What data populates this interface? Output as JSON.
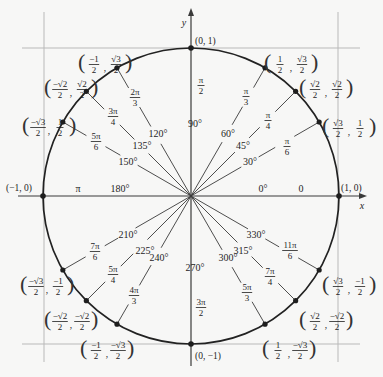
{
  "diagram": {
    "colors": {
      "background": "#f7f7f6",
      "ink": "#1e1e1e",
      "circle": "#222222",
      "radial": "#3a3a3a",
      "tangent_grid": "#b9b9b9",
      "axis": "#3a3a3a"
    },
    "geometry": {
      "cx": 191,
      "cy": 196,
      "r": 148
    },
    "axes": {
      "x_label": "x",
      "y_label": "y",
      "x_range": [
        18,
        362
      ],
      "y_range": [
        8,
        366
      ]
    },
    "tangent_lines": {
      "left_x": 44,
      "right_x": 338,
      "top_y": 48,
      "bottom_y": 344,
      "v_extent": [
        12,
        362
      ],
      "h_extent": [
        22,
        360
      ]
    },
    "axis_points": [
      {
        "deg": 0,
        "coord": "(1, 0)",
        "lx": 341,
        "ly": 191
      },
      {
        "deg": 90,
        "coord": "(0, 1)",
        "lx": 195,
        "ly": 44
      },
      {
        "deg": 180,
        "coord": "(−1, 0)",
        "lx": 6,
        "ly": 191
      },
      {
        "deg": 270,
        "coord": "(0, −1)",
        "lx": 195,
        "ly": 359
      }
    ],
    "axis_labels": [
      {
        "text": "0°",
        "x": 263,
        "y": 192,
        "cls": "deg"
      },
      {
        "text": "0",
        "x": 301,
        "y": 192,
        "cls": "deg"
      },
      {
        "text": "180°",
        "x": 120,
        "y": 192,
        "cls": "deg"
      },
      {
        "text": "π",
        "x": 78,
        "y": 192,
        "cls": "deg"
      },
      {
        "text": "90°",
        "x": 195,
        "y": 127,
        "cls": "deg"
      },
      {
        "text": "270°",
        "x": 195,
        "y": 271,
        "cls": "deg"
      }
    ],
    "axis_fracs": [
      {
        "num": "π",
        "den": "2",
        "x": 201,
        "y": 83
      },
      {
        "num": "3π",
        "den": "2",
        "x": 201,
        "y": 305
      }
    ],
    "angles": [
      {
        "deg": 30,
        "deg_label": "30°",
        "rad_num": "π",
        "rad_den": "6",
        "deg_pos": [
          250,
          162
        ],
        "rad_pos": [
          287,
          146
        ],
        "coord_x": {
          "neg": false,
          "num": "√3",
          "den": "2"
        },
        "coord_y": {
          "neg": false,
          "num": "1",
          "den": "2"
        },
        "coord_pos": [
          322,
          118
        ]
      },
      {
        "deg": 45,
        "deg_label": "45°",
        "rad_num": "π",
        "rad_den": "4",
        "deg_pos": [
          243,
          146
        ],
        "rad_pos": [
          268,
          120
        ],
        "coord_x": {
          "neg": false,
          "num": "√2",
          "den": "2"
        },
        "coord_y": {
          "neg": false,
          "num": "√2",
          "den": "2"
        },
        "coord_pos": [
          299,
          79
        ]
      },
      {
        "deg": 60,
        "deg_label": "60°",
        "rad_num": "π",
        "rad_den": "3",
        "deg_pos": [
          228,
          134
        ],
        "rad_pos": [
          246,
          96
        ],
        "coord_x": {
          "neg": false,
          "num": "1",
          "den": "2"
        },
        "coord_y": {
          "neg": false,
          "num": "√3",
          "den": "2"
        },
        "coord_pos": [
          264,
          54
        ]
      },
      {
        "deg": 120,
        "deg_label": "120°",
        "rad_num": "2π",
        "rad_den": "3",
        "deg_pos": [
          158,
          134
        ],
        "rad_pos": [
          135,
          97
        ],
        "coord_x": {
          "neg": true,
          "num": "−1",
          "den": "2"
        },
        "coord_y": {
          "neg": false,
          "num": "√3",
          "den": "2"
        },
        "coord_pos": [
          78,
          54
        ]
      },
      {
        "deg": 135,
        "deg_label": "135°",
        "rad_num": "3π",
        "rad_den": "4",
        "deg_pos": [
          142,
          146
        ],
        "rad_pos": [
          113,
          116
        ],
        "coord_x": {
          "neg": true,
          "num": "−√2",
          "den": "2"
        },
        "coord_y": {
          "neg": false,
          "num": "√2",
          "den": "2"
        },
        "coord_pos": [
          44,
          79
        ]
      },
      {
        "deg": 150,
        "deg_label": "150°",
        "rad_num": "5π",
        "rad_den": "6",
        "deg_pos": [
          128,
          162
        ],
        "rad_pos": [
          96,
          141
        ],
        "coord_x": {
          "neg": true,
          "num": "−√3",
          "den": "2"
        },
        "coord_y": {
          "neg": false,
          "num": "1",
          "den": "2"
        },
        "coord_pos": [
          22,
          117
        ]
      },
      {
        "deg": 210,
        "deg_label": "210°",
        "rad_num": "7π",
        "rad_den": "6",
        "deg_pos": [
          128,
          235
        ],
        "rad_pos": [
          95,
          251
        ],
        "coord_x": {
          "neg": true,
          "num": "−√3",
          "den": "2"
        },
        "coord_y": {
          "neg": true,
          "num": "−1",
          "den": "2"
        },
        "coord_pos": [
          20,
          276
        ]
      },
      {
        "deg": 225,
        "deg_label": "225°",
        "rad_num": "5π",
        "rad_den": "4",
        "deg_pos": [
          145,
          251
        ],
        "rad_pos": [
          113,
          274
        ],
        "coord_x": {
          "neg": true,
          "num": "−√2",
          "den": "2"
        },
        "coord_y": {
          "neg": true,
          "num": "−√2",
          "den": "2"
        },
        "coord_pos": [
          44,
          311
        ]
      },
      {
        "deg": 240,
        "deg_label": "240°",
        "rad_num": "4π",
        "rad_den": "3",
        "deg_pos": [
          159,
          258
        ],
        "rad_pos": [
          134,
          295
        ],
        "coord_x": {
          "neg": true,
          "num": "−1",
          "den": "2"
        },
        "coord_y": {
          "neg": true,
          "num": "−√3",
          "den": "2"
        },
        "coord_pos": [
          80,
          340
        ]
      },
      {
        "deg": 300,
        "deg_label": "300°",
        "rad_num": "5π",
        "rad_den": "3",
        "deg_pos": [
          228,
          258
        ],
        "rad_pos": [
          247,
          292
        ],
        "coord_x": {
          "neg": false,
          "num": "1",
          "den": "2"
        },
        "coord_y": {
          "neg": true,
          "num": "−√3",
          "den": "2"
        },
        "coord_pos": [
          262,
          340
        ]
      },
      {
        "deg": 315,
        "deg_label": "315°",
        "rad_num": "7π",
        "rad_den": "4",
        "deg_pos": [
          243,
          251
        ],
        "rad_pos": [
          270,
          276
        ],
        "coord_x": {
          "neg": false,
          "num": "√2",
          "den": "2"
        },
        "coord_y": {
          "neg": true,
          "num": "−√2",
          "den": "2"
        },
        "coord_pos": [
          299,
          311
        ]
      },
      {
        "deg": 330,
        "deg_label": "330°",
        "rad_num": "11π",
        "rad_den": "6",
        "deg_pos": [
          256,
          235
        ],
        "rad_pos": [
          290,
          250
        ],
        "coord_x": {
          "neg": false,
          "num": "√3",
          "den": "2"
        },
        "coord_y": {
          "neg": true,
          "num": "−1",
          "den": "2"
        },
        "coord_pos": [
          322,
          276
        ]
      }
    ]
  }
}
